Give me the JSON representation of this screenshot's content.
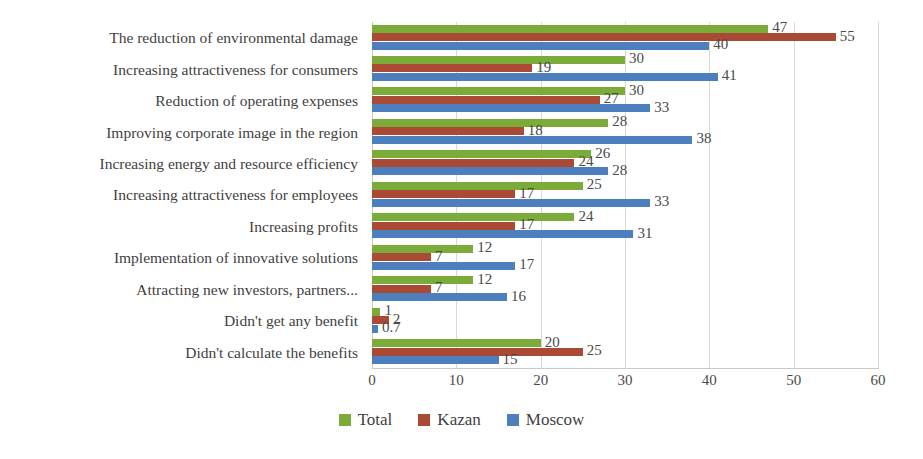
{
  "chart_data": {
    "type": "bar",
    "orientation": "horizontal",
    "title": "",
    "xlabel": "",
    "ylabel": "",
    "xlim": [
      0,
      60
    ],
    "xticks": [
      0,
      10,
      20,
      30,
      40,
      50,
      60
    ],
    "grid": true,
    "legend_position": "bottom",
    "categories": [
      "The reduction of environmental damage",
      "Increasing attractiveness for consumers",
      "Reduction of operating expenses",
      "Improving corporate image in the region",
      "Increasing energy and resource efficiency",
      "Increasing attractiveness for employees",
      "Increasing profits",
      "Implementation of innovative solutions",
      "Attracting new investors, partners...",
      "Didn't get any benefit",
      "Didn't calculate the benefits"
    ],
    "series": [
      {
        "name": "Total",
        "color": "#7bac39",
        "values": [
          47,
          30,
          30,
          28,
          26,
          25,
          24,
          12,
          12,
          1,
          20
        ],
        "labels": [
          "47",
          "30",
          "30",
          "28",
          "26",
          "25",
          "24",
          "12",
          "12",
          "1",
          "20"
        ]
      },
      {
        "name": "Kazan",
        "color": "#ab4a34",
        "values": [
          55,
          19,
          27,
          18,
          24,
          17,
          17,
          7,
          7,
          2,
          25
        ],
        "labels": [
          "55",
          "19",
          "27",
          "18",
          "24",
          "17",
          "17",
          "7",
          "7",
          "2",
          "25"
        ]
      },
      {
        "name": "Moscow",
        "color": "#4d7fbe",
        "values": [
          40,
          41,
          33,
          38,
          28,
          33,
          31,
          17,
          16,
          0.7,
          15
        ],
        "labels": [
          "40",
          "41",
          "33",
          "38",
          "28",
          "33",
          "31",
          "17",
          "16",
          "0.7",
          "15"
        ]
      }
    ]
  }
}
